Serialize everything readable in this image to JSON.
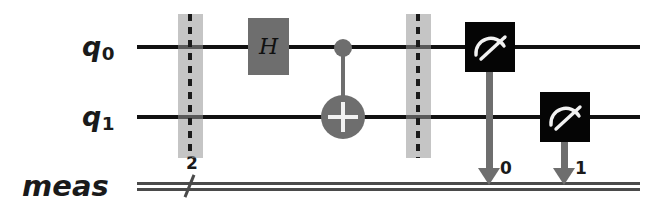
{
  "diagram": {
    "type": "quantum-circuit",
    "framework_style": "qiskit",
    "colors": {
      "wire": "#111111",
      "classical_wire": "#4a4a4a",
      "gate_gray": "#6e6e6e",
      "measure_black": "#050505",
      "barrier_band": "rgba(150,150,150,0.55)",
      "background": "#ffffff"
    }
  },
  "wires": [
    {
      "id": "q0",
      "label": "q",
      "subscript": "0",
      "kind": "quantum"
    },
    {
      "id": "q1",
      "label": "q",
      "subscript": "1",
      "kind": "quantum"
    },
    {
      "id": "meas",
      "label": "meas",
      "subscript": "",
      "kind": "classical",
      "width": "2"
    }
  ],
  "gates": [
    {
      "name": "barrier-1",
      "type": "barrier",
      "label": "",
      "wires": [
        "q0",
        "q1"
      ]
    },
    {
      "name": "hadamard",
      "type": "gate",
      "label": "H",
      "wires": [
        "q0"
      ]
    },
    {
      "name": "cnot",
      "type": "cx",
      "label": "",
      "control": "q0",
      "target": "q1"
    },
    {
      "name": "barrier-2",
      "type": "barrier",
      "label": "",
      "wires": [
        "q0",
        "q1"
      ]
    },
    {
      "name": "measure-q0",
      "type": "measure",
      "label": "",
      "wires": [
        "q0"
      ],
      "creg_index": "0"
    },
    {
      "name": "measure-q1",
      "type": "measure",
      "label": "",
      "wires": [
        "q1"
      ],
      "creg_index": "1"
    }
  ],
  "labels": {
    "q0": "q",
    "q0_sub": "0",
    "q1": "q",
    "q1_sub": "1",
    "meas": "meas",
    "creg_width": "2",
    "creg_index_0": "0",
    "creg_index_1": "1",
    "hadamard": "H"
  }
}
